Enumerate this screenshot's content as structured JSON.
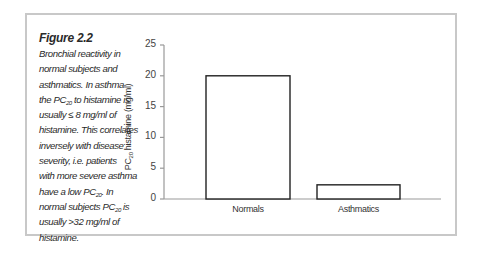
{
  "figure": {
    "title": "Figure 2.2",
    "caption_lines": [
      "Bronchial reactivity in",
      "normal subjects and",
      "asthmatics. In asthma",
      "the PC20 to histamine is",
      "usually ≤ 8 mg/ml of",
      "histamine. This correlates",
      "inversely with disease",
      "severity, i.e. patients",
      "with more severe asthma",
      "have a low PC20. In",
      "normal subjects PC20 is",
      "usually >32 mg/ml of",
      "histamine."
    ]
  },
  "chart_data": {
    "type": "bar",
    "title": "",
    "xlabel": "",
    "ylabel": "PC20 histamine (mg/ml)",
    "categories": [
      "Normals",
      "Asthmatics"
    ],
    "values": [
      20,
      2.3
    ],
    "ylim": [
      0,
      25
    ],
    "yticks": [
      0,
      5,
      10,
      15,
      20,
      25
    ],
    "grid": false,
    "legend": null,
    "colors": {
      "bar_fill": "#ffffff",
      "bar_stroke": "#222222",
      "axis": "#999999",
      "frame": "#c8c8c8"
    }
  }
}
